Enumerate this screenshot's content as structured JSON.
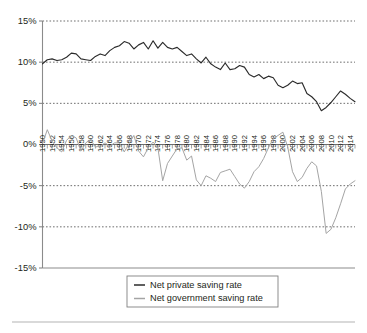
{
  "chart_data": {
    "type": "line",
    "title": "",
    "subtitle": "",
    "xlabel": "",
    "ylabel": "",
    "ylim": [
      -15,
      15
    ],
    "xlim": [
      1950,
      2015
    ],
    "ytick_labels": [
      "15%",
      "10%",
      "5%",
      "0%",
      "-5%",
      "-10%",
      "-15%"
    ],
    "ytick_values": [
      15,
      10,
      5,
      0,
      -5,
      -10,
      -15
    ],
    "grid": "horizontal-dotted",
    "legend_position": "bottom-center",
    "legend_entries": [
      "Net private saving rate",
      "Net government saving rate"
    ],
    "x": [
      1950,
      1951,
      1952,
      1953,
      1954,
      1955,
      1956,
      1957,
      1958,
      1959,
      1960,
      1961,
      1962,
      1963,
      1964,
      1965,
      1966,
      1967,
      1968,
      1969,
      1970,
      1971,
      1972,
      1973,
      1974,
      1975,
      1976,
      1977,
      1978,
      1979,
      1980,
      1981,
      1982,
      1983,
      1984,
      1985,
      1986,
      1987,
      1988,
      1989,
      1990,
      1991,
      1992,
      1993,
      1994,
      1995,
      1996,
      1997,
      1998,
      1999,
      2000,
      2001,
      2002,
      2003,
      2004,
      2005,
      2006,
      2007,
      2008,
      2009,
      2010,
      2011,
      2012,
      2013,
      2014,
      2015
    ],
    "xtick_labels": [
      "1950",
      "1952",
      "1954",
      "1956",
      "1958",
      "1960",
      "1962",
      "1964",
      "1966",
      "1968",
      "1970",
      "1972",
      "1974",
      "1976",
      "1978",
      "1980",
      "1982",
      "1984",
      "1986",
      "1988",
      "1990",
      "1992",
      "1994",
      "1996",
      "1998",
      "2000",
      "2002",
      "2004",
      "2006",
      "2008",
      "2010",
      "2012",
      "2014"
    ],
    "xtick_label_values": [
      1950,
      1952,
      1954,
      1956,
      1958,
      1960,
      1962,
      1964,
      1966,
      1968,
      1970,
      1972,
      1974,
      1976,
      1978,
      1980,
      1982,
      1984,
      1986,
      1988,
      1990,
      1992,
      1994,
      1996,
      1998,
      2000,
      2002,
      2004,
      2006,
      2008,
      2010,
      2012,
      2014
    ],
    "series": [
      {
        "name": "Net private saving rate",
        "color": "#2b2b2b",
        "values": [
          9.8,
          10.3,
          10.4,
          10.2,
          10.3,
          10.6,
          11.1,
          11.0,
          10.4,
          10.3,
          10.2,
          10.7,
          11.0,
          10.8,
          11.4,
          11.8,
          12.0,
          12.5,
          12.3,
          11.6,
          12.1,
          12.4,
          11.6,
          12.6,
          11.7,
          12.4,
          11.8,
          11.6,
          11.8,
          11.3,
          10.8,
          11.0,
          10.4,
          9.9,
          10.6,
          9.8,
          9.4,
          9.1,
          9.9,
          9.1,
          9.2,
          9.6,
          9.4,
          8.5,
          8.2,
          8.5,
          8.0,
          8.3,
          8.1,
          7.2,
          6.9,
          7.2,
          7.7,
          7.4,
          7.5,
          6.2,
          5.8,
          5.2,
          4.1,
          4.5,
          5.1,
          5.8,
          6.5,
          6.1,
          5.6,
          5.2
        ]
      },
      {
        "name": "Net government saving rate",
        "color": "#a4a4a4",
        "values": [
          0.1,
          1.8,
          0.4,
          -0.4,
          -0.9,
          0.5,
          1.1,
          0.8,
          -0.8,
          0.2,
          0.6,
          -0.3,
          -0.2,
          0.2,
          -0.2,
          0.2,
          0.2,
          -0.9,
          0.1,
          1.1,
          -0.8,
          -1.5,
          -0.4,
          0.3,
          -0.4,
          -4.4,
          -2.3,
          -1.4,
          -0.5,
          -0.4,
          -1.9,
          -1.4,
          -4.3,
          -5.0,
          -3.8,
          -4.1,
          -4.5,
          -3.4,
          -3.2,
          -3.0,
          -3.9,
          -4.8,
          -5.3,
          -4.5,
          -3.3,
          -2.7,
          -1.7,
          -0.4,
          0.7,
          1.1,
          1.5,
          -0.3,
          -3.3,
          -4.5,
          -4.0,
          -2.9,
          -2.1,
          -2.6,
          -5.7,
          -10.8,
          -10.3,
          -8.9,
          -7.2,
          -5.4,
          -4.8,
          -4.4
        ]
      }
    ]
  },
  "legend": {
    "items": [
      {
        "label": "Net private saving rate",
        "swatch": "line-swatch-dark"
      },
      {
        "label": "Net government saving rate",
        "swatch": "line-swatch-gray"
      }
    ]
  }
}
